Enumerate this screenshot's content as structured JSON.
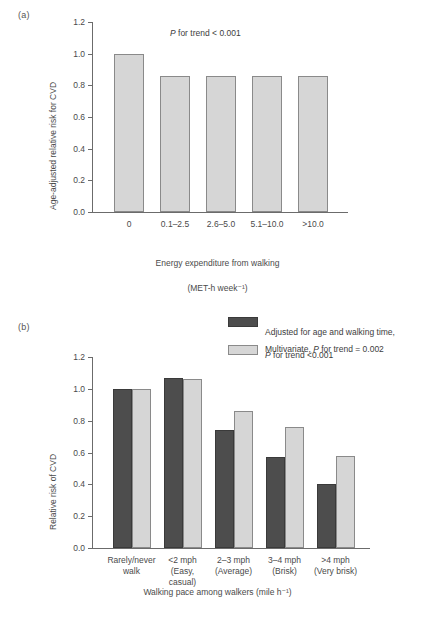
{
  "figure": {
    "panel_a_letter": "(a)",
    "panel_b_letter": "(b)"
  },
  "chart_data": [
    {
      "panel": "(a)",
      "type": "bar",
      "title": "",
      "annotation": "P for trend < 0.001",
      "annotation_prefix_italic": "P",
      "annotation_rest": " for trend < 0.001",
      "categories": [
        "0",
        "0.1–2.5",
        "2.6–5.0",
        "5.1–10.0",
        ">10.0"
      ],
      "values": [
        1.0,
        0.86,
        0.86,
        0.86,
        0.86
      ],
      "series": [
        {
          "name": "Age-adjusted relative risk for CVD",
          "values": [
            1.0,
            0.86,
            0.86,
            0.86,
            0.86
          ],
          "color": "#d6d6d6"
        }
      ],
      "xlabel": "Energy expenditure from walking\n(MET-h week⁻¹)",
      "xlabel_line1": "Energy expenditure from walking",
      "xlabel_line2": "(MET-h week⁻¹)",
      "ylabel": "Age-adjusted relative risk for CVD",
      "ylim": [
        0.0,
        1.2
      ],
      "yticks": [
        "0.0",
        "0.2",
        "0.4",
        "0.6",
        "0.8",
        "1.0",
        "1.2"
      ],
      "ytick_values": [
        0.0,
        0.2,
        0.4,
        0.6,
        0.8,
        1.0,
        1.2
      ],
      "grid": false,
      "legend": "none"
    },
    {
      "panel": "(b)",
      "type": "bar",
      "title": "",
      "categories": [
        "Rarely/never\nwalk",
        "<2 mph\n(Easy,\ncasual)",
        "2–3 mph\n(Average)",
        "3–4 mph\n(Brisk)",
        ">4 mph\n(Very brisk)"
      ],
      "series": [
        {
          "name": "Adjusted for age  and walking time, P for trend <0.001",
          "name_line1": "Adjusted for age  and walking time,",
          "name_line2_italic": "P",
          "name_line2_rest": " for trend <0.001",
          "values": [
            1.0,
            1.07,
            0.74,
            0.57,
            0.4
          ],
          "color": "#4d4d4d"
        },
        {
          "name": "Multivariate, P for trend = 0.002",
          "name_prefix": "Multivariate, ",
          "name_italic": "P",
          "name_rest": " for trend = 0.002",
          "values": [
            1.0,
            1.06,
            0.86,
            0.76,
            0.58
          ],
          "color": "#d6d6d6"
        }
      ],
      "xlabel": "Walking pace among walkers (mile h⁻¹)",
      "ylabel": "Relative risk of CVD",
      "ylim": [
        0.0,
        1.2
      ],
      "yticks": [
        "0.0",
        "0.2",
        "0.4",
        "0.6",
        "0.8",
        "1.0",
        "1.2"
      ],
      "ytick_values": [
        0.0,
        0.2,
        0.4,
        0.6,
        0.8,
        1.0,
        1.2
      ],
      "grid": false,
      "legend_position": "top-right"
    }
  ]
}
